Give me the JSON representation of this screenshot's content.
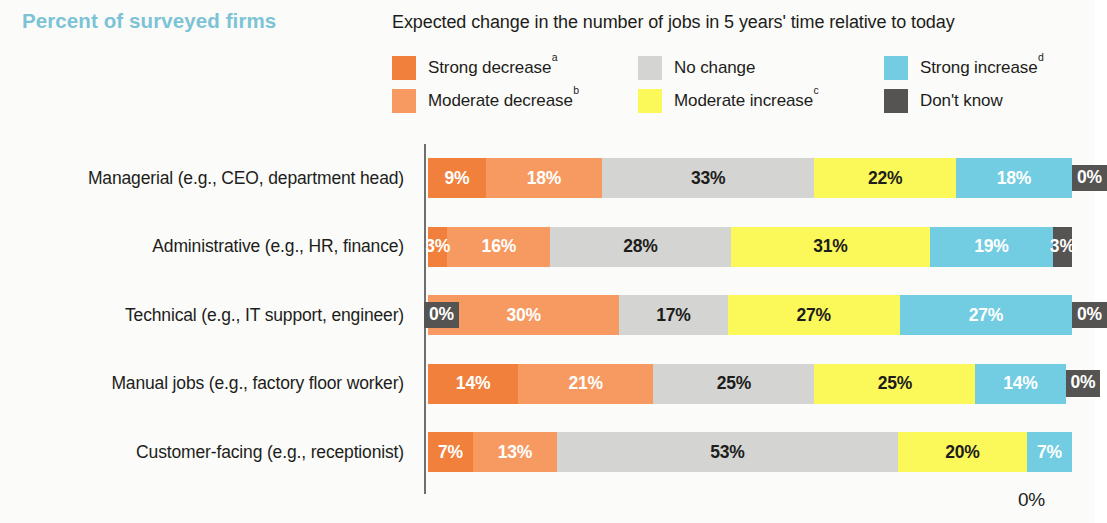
{
  "header": {
    "title": "Percent of surveyed firms",
    "title_color": "#7cc3d6",
    "legend_title": "Expected change in the number of jobs in 5 years' time relative to today"
  },
  "legend": {
    "items": [
      {
        "label": "Strong decrease",
        "sup": "a",
        "color": "#f0803c",
        "col": 0,
        "row": 0
      },
      {
        "label": "Moderate decrease",
        "sup": "b",
        "color": "#f79a62",
        "col": 0,
        "row": 1
      },
      {
        "label": "No change",
        "sup": "",
        "color": "#d4d4d2",
        "col": 1,
        "row": 0
      },
      {
        "label": "Moderate increase",
        "sup": "c",
        "color": "#fbf85a",
        "col": 1,
        "row": 1
      },
      {
        "label": "Strong increase",
        "sup": "d",
        "color": "#72cde2",
        "col": 2,
        "row": 0
      },
      {
        "label": "Don't know",
        "sup": "",
        "color": "#555452",
        "col": 2,
        "row": 1
      }
    ]
  },
  "axis": {
    "zero_label": "0%"
  },
  "chart_data": {
    "type": "bar",
    "orientation": "horizontal",
    "stacked": true,
    "title": "Percent of surveyed firms",
    "subtitle": "Expected change in the number of jobs in 5 years' time relative to today",
    "xlabel": "",
    "ylabel": "",
    "xlim": [
      0,
      100
    ],
    "grid": false,
    "legend_position": "top",
    "categories": [
      "Managerial (e.g., CEO, department head)",
      "Administrative (e.g., HR, finance)",
      "Technical (e.g., IT support, engineer)",
      "Manual jobs (e.g., factory floor worker)",
      "Customer-facing (e.g., receptionist)"
    ],
    "series": [
      {
        "name": "Strong decrease",
        "color": "#f0803c",
        "text_color": "#ffffff",
        "values": [
          9,
          3,
          0,
          14,
          7
        ]
      },
      {
        "name": "Moderate decrease",
        "color": "#f79a62",
        "text_color": "#ffffff",
        "values": [
          18,
          16,
          30,
          21,
          13
        ]
      },
      {
        "name": "No change",
        "color": "#d4d4d2",
        "text_color": "#1d1d1b",
        "values": [
          33,
          28,
          17,
          25,
          53
        ]
      },
      {
        "name": "Moderate increase",
        "color": "#fbf85a",
        "text_color": "#1d1d1b",
        "values": [
          22,
          31,
          27,
          25,
          20
        ]
      },
      {
        "name": "Strong increase",
        "color": "#72cde2",
        "text_color": "#ffffff",
        "values": [
          18,
          19,
          27,
          14,
          7
        ]
      },
      {
        "name": "Don't know",
        "color": "#555452",
        "text_color": "#ffffff",
        "values": [
          0,
          3,
          0,
          0,
          null
        ]
      }
    ],
    "value_labels": [
      [
        "9%",
        "18%",
        "33%",
        "22%",
        "18%",
        "0%"
      ],
      [
        "3%",
        "16%",
        "28%",
        "31%",
        "19%",
        "3%"
      ],
      [
        "0%",
        "30%",
        "17%",
        "27%",
        "27%",
        "0%"
      ],
      [
        "14%",
        "21%",
        "25%",
        "25%",
        "14%",
        "0%"
      ],
      [
        "7%",
        "13%",
        "53%",
        "20%",
        "7%",
        ""
      ]
    ]
  }
}
